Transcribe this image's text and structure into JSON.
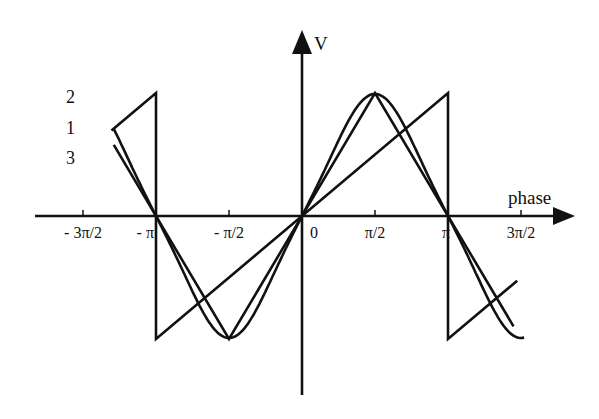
{
  "diagram": {
    "axes": {
      "x_label": "phase",
      "y_label": "V",
      "x_ticks": [
        {
          "value": -4.712389,
          "label": "- 3π/2"
        },
        {
          "value": -3.141593,
          "label": "- π"
        },
        {
          "value": -1.570796,
          "label": "- π/2"
        },
        {
          "value": 0,
          "label": "0"
        },
        {
          "value": 1.570796,
          "label": "π/2"
        },
        {
          "value": 3.141593,
          "label": "π"
        },
        {
          "value": 4.712389,
          "label": "3π/2"
        }
      ],
      "x_range": [
        -5.0,
        5.8
      ],
      "y_range": [
        -1.4,
        1.4
      ]
    },
    "curves": [
      {
        "id": "1",
        "label": "1",
        "kind": "sine-like (smooth)",
        "amplitude": 0.85
      },
      {
        "id": "2",
        "label": "2",
        "kind": "triangle",
        "amplitude": 1.0
      },
      {
        "id": "3",
        "label": "3",
        "kind": "sawtooth",
        "amplitude": 1.0
      }
    ]
  }
}
